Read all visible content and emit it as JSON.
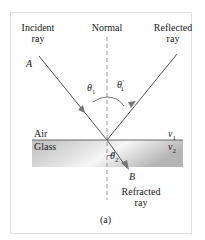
{
  "figure": {
    "labels": {
      "incident_line1": "Incident",
      "incident_line2": "ray",
      "normal": "Normal",
      "reflected_line1": "Reflected",
      "reflected_line2": "ray",
      "point_a": "A",
      "point_b": "B",
      "theta1": "θ",
      "theta1_sub": "1",
      "theta1_prime": "θ",
      "theta1_prime_sub": "1",
      "theta1_prime_mark": "′",
      "theta2": "θ",
      "theta2_sub": "2",
      "air": "Air",
      "glass": "Glass",
      "v1": "v",
      "v1_sub": "1",
      "v2": "v",
      "v2_sub": "2",
      "refracted_line1": "Refracted",
      "refracted_line2": "ray",
      "caption": "(a)"
    },
    "colors": {
      "ray": "#555555",
      "arrowhead": "#777777",
      "normal_dash": "#999999",
      "interface": "#666666",
      "glass_light": "#f4f4f4",
      "glass_dark": "#b8b8b8"
    }
  }
}
